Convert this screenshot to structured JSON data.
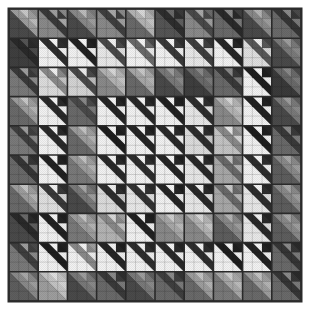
{
  "artwork": {
    "title": "Birds in the Air Quilt",
    "type": "patchwork-quilt-render",
    "background_color": "#ffffff",
    "sashing_color": "#2b2b2b",
    "canvas": {
      "width": 309,
      "height": 322
    },
    "quilt_area": {
      "x": 9,
      "y": 9,
      "width": 292,
      "height": 292
    },
    "grid": {
      "rows": 10,
      "cols": 10
    },
    "block": {
      "name": "birds-in-the-air",
      "units": 3,
      "description": "Large half-block triangle in the lower-left; three small half-square-triangle units along the upper-right, each split on the anti-diagonal."
    },
    "palette": {
      "lightest": "#e8e8e8",
      "light": "#c4c4c4",
      "mid_light": "#9e9e9e",
      "mid": "#7a7a7a",
      "mid_dark": "#585858",
      "dark": "#3a3a3a",
      "darkest": "#1e1e1e",
      "accent_white": "#f5f5f5",
      "seam": "#262626"
    },
    "texture": {
      "enabled": true,
      "kind": "fine-diagonal-weave",
      "opacity": 0.12
    }
  },
  "chart_data": {
    "type": "heatmap",
    "xlabel": "",
    "ylabel": "",
    "categories": [
      "c1",
      "c2",
      "c3",
      "c4",
      "c5",
      "c6",
      "c7",
      "c8",
      "c9",
      "c10"
    ],
    "rows": [
      "r1",
      "r2",
      "r3",
      "r4",
      "r5",
      "r6",
      "r7",
      "r8",
      "r9",
      "r10"
    ],
    "legend": [],
    "grid": false,
    "note": "values = mean luminance (0-255) of each quilt block, 10x10",
    "values": [
      [
        132,
        58,
        118,
        62,
        150,
        44,
        72,
        40,
        118,
        52
      ],
      [
        40,
        150,
        34,
        118,
        160,
        150,
        142,
        40,
        124,
        120
      ],
      [
        56,
        130,
        104,
        168,
        150,
        120,
        96,
        60,
        34,
        108
      ],
      [
        138,
        44,
        70,
        38,
        46,
        40,
        52,
        150,
        36,
        118
      ],
      [
        62,
        44,
        142,
        36,
        38,
        34,
        130,
        168,
        30,
        56
      ],
      [
        52,
        34,
        140,
        44,
        38,
        42,
        40,
        108,
        44,
        122
      ],
      [
        130,
        62,
        108,
        46,
        52,
        38,
        40,
        108,
        42,
        120
      ],
      [
        44,
        34,
        140,
        120,
        36,
        148,
        160,
        130,
        40,
        128
      ],
      [
        62,
        34,
        148,
        40,
        46,
        42,
        46,
        30,
        34,
        58
      ],
      [
        122,
        166,
        112,
        58,
        120,
        62,
        140,
        148,
        140,
        58
      ]
    ]
  },
  "blocks": [
    [
      {
        "bg": "#9e9e9e",
        "tri": "#4a4a4a",
        "b1": "#c8c8c8",
        "b2": "#8a8a8a",
        "b3": "#bcbcbc",
        "rot": 0
      },
      {
        "bg": "#3a3a3a",
        "tri": "#8a8a8a",
        "b1": "#9e9e9e",
        "b2": "#8a8a8a",
        "b3": "#a8a8a8",
        "rot": 0
      },
      {
        "bg": "#8a8a8a",
        "tri": "#4a4a4a",
        "b1": "#bcbcbc",
        "b2": "#7a7a7a",
        "b3": "#9e9e9e",
        "rot": 0
      },
      {
        "bg": "#3f3f3f",
        "tri": "#8a8a8a",
        "b1": "#a8a8a8",
        "b2": "#8a8a8a",
        "b3": "#9e9e9e",
        "rot": 0
      },
      {
        "bg": "#b4b4b4",
        "tri": "#6a6a6a",
        "b1": "#d8d8d8",
        "b2": "#9e9e9e",
        "b3": "#c4c4c4",
        "rot": 0
      },
      {
        "bg": "#2e2e2e",
        "tri": "#555555",
        "b1": "#6a6a6a",
        "b2": "#3a3a3a",
        "b3": "#5e5e5e",
        "rot": 0
      },
      {
        "bg": "#4a4a4a",
        "tri": "#8a8a8a",
        "b1": "#a8a8a8",
        "b2": "#6a6a6a",
        "b3": "#9e9e9e",
        "rot": 0
      },
      {
        "bg": "#2a2a2a",
        "tri": "#6a6a6a",
        "b1": "#8a8a8a",
        "b2": "#3f3f3f",
        "b3": "#7a7a7a",
        "rot": 0
      },
      {
        "bg": "#8a8a8a",
        "tri": "#4a4a4a",
        "b1": "#b4b4b4",
        "b2": "#6a6a6a",
        "b3": "#9e9e9e",
        "rot": 0
      },
      {
        "bg": "#363636",
        "tri": "#6a6a6a",
        "b1": "#8a8a8a",
        "b2": "#4a4a4a",
        "b3": "#7a7a7a",
        "rot": 0
      }
    ],
    [
      {
        "bg": "#2a2a2a",
        "tri": "#3f3f3f",
        "b1": "#555555",
        "b2": "#2e2e2e",
        "b3": "#4a4a4a",
        "rot": 0
      },
      {
        "bg": "#2e2e2e",
        "tri": "#f2f2f2",
        "b1": "#f5f5f5",
        "b2": "#2a2a2a",
        "b3": "#f0f0f0",
        "rot": 0
      },
      {
        "bg": "#222222",
        "tri": "#f2f2f2",
        "b1": "#f5f5f5",
        "b2": "#1e1e1e",
        "b3": "#ededed",
        "rot": 0
      },
      {
        "bg": "#4a4a4a",
        "tri": "#e8e8e8",
        "b1": "#f2f2f2",
        "b2": "#3a3a3a",
        "b3": "#dcdcdc",
        "rot": 0
      },
      {
        "bg": "#6a6a6a",
        "tri": "#f2f2f2",
        "b1": "#f5f5f5",
        "b2": "#4a4a4a",
        "b3": "#e8e8e8",
        "rot": 0
      },
      {
        "bg": "#3a3a3a",
        "tri": "#f2f2f2",
        "b1": "#f5f5f5",
        "b2": "#2e2e2e",
        "b3": "#ededed",
        "rot": 0
      },
      {
        "bg": "#3f3f3f",
        "tri": "#e8e8e8",
        "b1": "#f2f2f2",
        "b2": "#333333",
        "b3": "#dcdcdc",
        "rot": 0
      },
      {
        "bg": "#262626",
        "tri": "#f2f2f2",
        "b1": "#f5f5f5",
        "b2": "#1e1e1e",
        "b3": "#ededed",
        "rot": 0
      },
      {
        "bg": "#585858",
        "tri": "#e0e0e0",
        "b1": "#ededed",
        "b2": "#444444",
        "b3": "#d4d4d4",
        "rot": 0
      },
      {
        "bg": "#7a7a7a",
        "tri": "#4a4a4a",
        "b1": "#9e9e9e",
        "b2": "#5e5e5e",
        "b3": "#8a8a8a",
        "rot": 0
      }
    ],
    [
      {
        "bg": "#3a3a3a",
        "tri": "#7a7a7a",
        "b1": "#9e9e9e",
        "b2": "#4a4a4a",
        "b3": "#8a8a8a",
        "rot": 0
      },
      {
        "bg": "#8a8a8a",
        "tri": "#dcdcdc",
        "b1": "#f2f2f2",
        "b2": "#6a6a6a",
        "b3": "#c4c4c4",
        "rot": 0
      },
      {
        "bg": "#4a4a4a",
        "tri": "#d4d4d4",
        "b1": "#ededed",
        "b2": "#3a3a3a",
        "b3": "#bcbcbc",
        "rot": 0
      },
      {
        "bg": "#b4b4b4",
        "tri": "#8a8a8a",
        "b1": "#d8d8d8",
        "b2": "#9e9e9e",
        "b3": "#c4c4c4",
        "rot": 0
      },
      {
        "bg": "#a8a8a8",
        "tri": "#6a6a6a",
        "b1": "#c8c8c8",
        "b2": "#8a8a8a",
        "b3": "#b4b4b4",
        "rot": 0
      },
      {
        "bg": "#7a7a7a",
        "tri": "#4a4a4a",
        "b1": "#9e9e9e",
        "b2": "#5e5e5e",
        "b3": "#8a8a8a",
        "rot": 0
      },
      {
        "bg": "#6a6a6a",
        "tri": "#3f3f3f",
        "b1": "#8a8a8a",
        "b2": "#4a4a4a",
        "b3": "#7a7a7a",
        "rot": 0
      },
      {
        "bg": "#3a3a3a",
        "tri": "#6a6a6a",
        "b1": "#8a8a8a",
        "b2": "#2e2e2e",
        "b3": "#7a7a7a",
        "rot": 0
      },
      {
        "bg": "#1e1e1e",
        "tri": "#f2f2f2",
        "b1": "#f5f5f5",
        "b2": "#222222",
        "b3": "#ededed",
        "rot": 0
      },
      {
        "bg": "#6a6a6a",
        "tri": "#3a3a3a",
        "b1": "#8a8a8a",
        "b2": "#4a4a4a",
        "b3": "#7a7a7a",
        "rot": 0
      }
    ],
    [
      {
        "bg": "#9e9e9e",
        "tri": "#6a6a6a",
        "b1": "#c8c8c8",
        "b2": "#8a8a8a",
        "b3": "#b4b4b4",
        "rot": 0
      },
      {
        "bg": "#2a2a2a",
        "tri": "#f2f2f2",
        "b1": "#f5f5f5",
        "b2": "#1e1e1e",
        "b3": "#ededed",
        "rot": 0
      },
      {
        "bg": "#4a4a4a",
        "tri": "#6a6a6a",
        "b1": "#8a8a8a",
        "b2": "#3a3a3a",
        "b3": "#7a7a7a",
        "rot": 0
      },
      {
        "bg": "#262626",
        "tri": "#f2f2f2",
        "b1": "#f5f5f5",
        "b2": "#1e1e1e",
        "b3": "#ededed",
        "rot": 0
      },
      {
        "bg": "#2a2a2a",
        "tri": "#f2f2f2",
        "b1": "#f5f5f5",
        "b2": "#222222",
        "b3": "#ededed",
        "rot": 0
      },
      {
        "bg": "#222222",
        "tri": "#f2f2f2",
        "b1": "#f5f5f5",
        "b2": "#1e1e1e",
        "b3": "#f0f0f0",
        "rot": 0
      },
      {
        "bg": "#2e2e2e",
        "tri": "#e8e8e8",
        "b1": "#f2f2f2",
        "b2": "#262626",
        "b3": "#dcdcdc",
        "rot": 0
      },
      {
        "bg": "#b4b4b4",
        "tri": "#8a8a8a",
        "b1": "#d8d8d8",
        "b2": "#9e9e9e",
        "b3": "#c4c4c4",
        "rot": 0
      },
      {
        "bg": "#222222",
        "tri": "#f2f2f2",
        "b1": "#f5f5f5",
        "b2": "#1e1e1e",
        "b3": "#ededed",
        "rot": 0
      },
      {
        "bg": "#7a7a7a",
        "tri": "#4a4a4a",
        "b1": "#9e9e9e",
        "b2": "#5e5e5e",
        "b3": "#8a8a8a",
        "rot": 0
      }
    ],
    [
      {
        "bg": "#3f3f3f",
        "tri": "#7a7a7a",
        "b1": "#9e9e9e",
        "b2": "#4a4a4a",
        "b3": "#8a8a8a",
        "rot": 0
      },
      {
        "bg": "#2a2a2a",
        "tri": "#f2f2f2",
        "b1": "#f5f5f5",
        "b2": "#1e1e1e",
        "b3": "#ededed",
        "rot": 0
      },
      {
        "bg": "#9e9e9e",
        "tri": "#6a6a6a",
        "b1": "#c4c4c4",
        "b2": "#8a8a8a",
        "b3": "#b4b4b4",
        "rot": 0
      },
      {
        "bg": "#1e1e1e",
        "tri": "#f2f2f2",
        "b1": "#f5f5f5",
        "b2": "#222222",
        "b3": "#f0f0f0",
        "rot": 0
      },
      {
        "bg": "#262626",
        "tri": "#f2f2f2",
        "b1": "#f5f5f5",
        "b2": "#1e1e1e",
        "b3": "#ededed",
        "rot": 0
      },
      {
        "bg": "#2a2a2a",
        "tri": "#f2f2f2",
        "b1": "#f5f5f5",
        "b2": "#222222",
        "b3": "#ededed",
        "rot": 0
      },
      {
        "bg": "#2e2e2e",
        "tri": "#dcdcdc",
        "b1": "#ededed",
        "b2": "#262626",
        "b3": "#c8c8c8",
        "rot": 0
      },
      {
        "bg": "#8a8a8a",
        "tri": "#c4c4c4",
        "b1": "#e8e8e8",
        "b2": "#9e9e9e",
        "b3": "#d4d4d4",
        "rot": 0
      },
      {
        "bg": "#1e1e1e",
        "tri": "#f2f2f2",
        "b1": "#f5f5f5",
        "b2": "#222222",
        "b3": "#ededed",
        "rot": 0
      },
      {
        "bg": "#3a3a3a",
        "tri": "#6a6a6a",
        "b1": "#8a8a8a",
        "b2": "#2e2e2e",
        "b3": "#7a7a7a",
        "rot": 0
      }
    ],
    [
      {
        "bg": "#363636",
        "tri": "#6a6a6a",
        "b1": "#8a8a8a",
        "b2": "#2e2e2e",
        "b3": "#7a7a7a",
        "rot": 0
      },
      {
        "bg": "#222222",
        "tri": "#f2f2f2",
        "b1": "#f5f5f5",
        "b2": "#1e1e1e",
        "b3": "#ededed",
        "rot": 0
      },
      {
        "bg": "#9e9e9e",
        "tri": "#7a7a7a",
        "b1": "#c4c4c4",
        "b2": "#8a8a8a",
        "b3": "#b4b4b4",
        "rot": 0
      },
      {
        "bg": "#2a2a2a",
        "tri": "#f2f2f2",
        "b1": "#f5f5f5",
        "b2": "#222222",
        "b3": "#ededed",
        "rot": 0
      },
      {
        "bg": "#2e2e2e",
        "tri": "#f2f2f2",
        "b1": "#f5f5f5",
        "b2": "#262626",
        "b3": "#ededed",
        "rot": 0
      },
      {
        "bg": "#262626",
        "tri": "#f2f2f2",
        "b1": "#f5f5f5",
        "b2": "#1e1e1e",
        "b3": "#f0f0f0",
        "rot": 0
      },
      {
        "bg": "#2a2a2a",
        "tri": "#e8e8e8",
        "b1": "#f2f2f2",
        "b2": "#222222",
        "b3": "#dcdcdc",
        "rot": 0
      },
      {
        "bg": "#6a6a6a",
        "tri": "#a8a8a8",
        "b1": "#c4c4c4",
        "b2": "#7a7a7a",
        "b3": "#b4b4b4",
        "rot": 0
      },
      {
        "bg": "#2e2e2e",
        "tri": "#f2f2f2",
        "b1": "#f5f5f5",
        "b2": "#262626",
        "b3": "#ededed",
        "rot": 0
      },
      {
        "bg": "#8a8a8a",
        "tri": "#5e5e5e",
        "b1": "#a8a8a8",
        "b2": "#6a6a6a",
        "b3": "#9e9e9e",
        "rot": 0
      }
    ],
    [
      {
        "bg": "#9e9e9e",
        "tri": "#6a6a6a",
        "b1": "#c4c4c4",
        "b2": "#8a8a8a",
        "b3": "#b4b4b4",
        "rot": 0
      },
      {
        "bg": "#3a3a3a",
        "tri": "#e0e0e0",
        "b1": "#f2f2f2",
        "b2": "#2e2e2e",
        "b3": "#d4d4d4",
        "rot": 0
      },
      {
        "bg": "#7a7a7a",
        "tri": "#4a4a4a",
        "b1": "#a8a8a8",
        "b2": "#6a6a6a",
        "b3": "#9e9e9e",
        "rot": 0
      },
      {
        "bg": "#2e2e2e",
        "tri": "#dcdcdc",
        "b1": "#ededed",
        "b2": "#262626",
        "b3": "#c8c8c8",
        "rot": 0
      },
      {
        "bg": "#333333",
        "tri": "#e8e8e8",
        "b1": "#f2f2f2",
        "b2": "#2a2a2a",
        "b3": "#dcdcdc",
        "rot": 0
      },
      {
        "bg": "#262626",
        "tri": "#f2f2f2",
        "b1": "#f5f5f5",
        "b2": "#1e1e1e",
        "b3": "#ededed",
        "rot": 0
      },
      {
        "bg": "#2a2a2a",
        "tri": "#e8e8e8",
        "b1": "#f2f2f2",
        "b2": "#222222",
        "b3": "#dcdcdc",
        "rot": 0
      },
      {
        "bg": "#6a6a6a",
        "tri": "#a8a8a8",
        "b1": "#c8c8c8",
        "b2": "#7a7a7a",
        "b3": "#b4b4b4",
        "rot": 0
      },
      {
        "bg": "#2e2e2e",
        "tri": "#e8e8e8",
        "b1": "#f2f2f2",
        "b2": "#262626",
        "b3": "#dcdcdc",
        "rot": 0
      },
      {
        "bg": "#8a8a8a",
        "tri": "#5e5e5e",
        "b1": "#a8a8a8",
        "b2": "#6a6a6a",
        "b3": "#9e9e9e",
        "rot": 0
      }
    ],
    [
      {
        "bg": "#2a2a2a",
        "tri": "#4a4a4a",
        "b1": "#6a6a6a",
        "b2": "#222222",
        "b3": "#5e5e5e",
        "rot": 0
      },
      {
        "bg": "#222222",
        "tri": "#f2f2f2",
        "b1": "#f5f5f5",
        "b2": "#1e1e1e",
        "b3": "#ededed",
        "rot": 0
      },
      {
        "bg": "#9e9e9e",
        "tri": "#7a7a7a",
        "b1": "#c8c8c8",
        "b2": "#8a8a8a",
        "b3": "#b4b4b4",
        "rot": 0
      },
      {
        "bg": "#8a8a8a",
        "tri": "#b4b4b4",
        "b1": "#d8d8d8",
        "b2": "#9e9e9e",
        "b3": "#c4c4c4",
        "rot": 0
      },
      {
        "bg": "#222222",
        "tri": "#f2f2f2",
        "b1": "#f5f5f5",
        "b2": "#1e1e1e",
        "b3": "#ededed",
        "rot": 0
      },
      {
        "bg": "#a8a8a8",
        "tri": "#8a8a8a",
        "b1": "#cecece",
        "b2": "#9e9e9e",
        "b3": "#bcbcbc",
        "rot": 0
      },
      {
        "bg": "#b4b4b4",
        "tri": "#8a8a8a",
        "b1": "#d8d8d8",
        "b2": "#9e9e9e",
        "b3": "#c8c8c8",
        "rot": 0
      },
      {
        "bg": "#8a8a8a",
        "tri": "#5e5e5e",
        "b1": "#b4b4b4",
        "b2": "#6a6a6a",
        "b3": "#9e9e9e",
        "rot": 0
      },
      {
        "bg": "#2a2a2a",
        "tri": "#e8e8e8",
        "b1": "#f2f2f2",
        "b2": "#222222",
        "b3": "#dcdcdc",
        "rot": 0
      },
      {
        "bg": "#8a8a8a",
        "tri": "#5e5e5e",
        "b1": "#a8a8a8",
        "b2": "#6a6a6a",
        "b3": "#9e9e9e",
        "rot": 0
      }
    ],
    [
      {
        "bg": "#3f3f3f",
        "tri": "#7a7a7a",
        "b1": "#9e9e9e",
        "b2": "#4a4a4a",
        "b3": "#8a8a8a",
        "rot": 0
      },
      {
        "bg": "#1e1e1e",
        "tri": "#f2f2f2",
        "b1": "#f5f5f5",
        "b2": "#222222",
        "b3": "#f0f0f0",
        "rot": 0
      },
      {
        "bg": "#8a8a8a",
        "tri": "#f2f2f2",
        "b1": "#f5f5f5",
        "b2": "#9e9e9e",
        "b3": "#ededed",
        "rot": 0
      },
      {
        "bg": "#262626",
        "tri": "#f2f2f2",
        "b1": "#f5f5f5",
        "b2": "#1e1e1e",
        "b3": "#ededed",
        "rot": 0
      },
      {
        "bg": "#2e2e2e",
        "tri": "#f2f2f2",
        "b1": "#f5f5f5",
        "b2": "#262626",
        "b3": "#ededed",
        "rot": 0
      },
      {
        "bg": "#2a2a2a",
        "tri": "#f2f2f2",
        "b1": "#f5f5f5",
        "b2": "#222222",
        "b3": "#ededed",
        "rot": 0
      },
      {
        "bg": "#2e2e2e",
        "tri": "#f2f2f2",
        "b1": "#f5f5f5",
        "b2": "#262626",
        "b3": "#ededed",
        "rot": 0
      },
      {
        "bg": "#1e1e1e",
        "tri": "#f2f2f2",
        "b1": "#f5f5f5",
        "b2": "#222222",
        "b3": "#f0f0f0",
        "rot": 0
      },
      {
        "bg": "#222222",
        "tri": "#f2f2f2",
        "b1": "#f5f5f5",
        "b2": "#1e1e1e",
        "b3": "#ededed",
        "rot": 0
      },
      {
        "bg": "#363636",
        "tri": "#6a6a6a",
        "b1": "#8a8a8a",
        "b2": "#2a2a2a",
        "b3": "#7a7a7a",
        "rot": 0
      }
    ],
    [
      {
        "bg": "#8a8a8a",
        "tri": "#5e5e5e",
        "b1": "#a8a8a8",
        "b2": "#6a6a6a",
        "b3": "#9e9e9e",
        "rot": 0
      },
      {
        "bg": "#c4c4c4",
        "tri": "#9e9e9e",
        "b1": "#e0e0e0",
        "b2": "#b4b4b4",
        "b3": "#d4d4d4",
        "rot": 0
      },
      {
        "bg": "#7a7a7a",
        "tri": "#4a4a4a",
        "b1": "#9e9e9e",
        "b2": "#5e5e5e",
        "b3": "#8a8a8a",
        "rot": 0
      },
      {
        "bg": "#3a3a3a",
        "tri": "#6a6a6a",
        "b1": "#8a8a8a",
        "b2": "#2e2e2e",
        "b3": "#7a7a7a",
        "rot": 0
      },
      {
        "bg": "#7a7a7a",
        "tri": "#4a4a4a",
        "b1": "#9e9e9e",
        "b2": "#5e5e5e",
        "b3": "#8a8a8a",
        "rot": 0
      },
      {
        "bg": "#3f3f3f",
        "tri": "#6a6a6a",
        "b1": "#8a8a8a",
        "b2": "#333333",
        "b3": "#7a7a7a",
        "rot": 0
      },
      {
        "bg": "#9e9e9e",
        "tri": "#6a6a6a",
        "b1": "#c4c4c4",
        "b2": "#8a8a8a",
        "b3": "#b4b4b4",
        "rot": 0
      },
      {
        "bg": "#a8a8a8",
        "tri": "#7a7a7a",
        "b1": "#cecece",
        "b2": "#9e9e9e",
        "b3": "#bcbcbc",
        "rot": 0
      },
      {
        "bg": "#9e9e9e",
        "tri": "#6a6a6a",
        "b1": "#c4c4c4",
        "b2": "#8a8a8a",
        "b3": "#b4b4b4",
        "rot": 0
      },
      {
        "bg": "#363636",
        "tri": "#6a6a6a",
        "b1": "#8a8a8a",
        "b2": "#2a2a2a",
        "b3": "#7a7a7a",
        "rot": 0
      }
    ]
  ]
}
